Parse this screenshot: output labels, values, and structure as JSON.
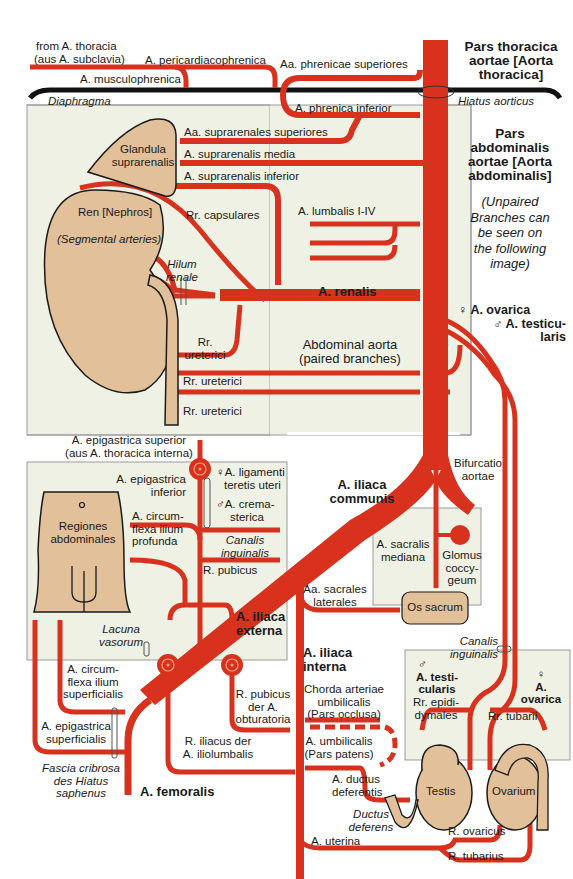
{
  "colors": {
    "artery": "#d8311e",
    "panel_bg": "#eef1e3",
    "organ_fill": "#e2c09a",
    "outline": "#1a1a1a",
    "diaphragm": "#111111",
    "background": "#ffffff"
  },
  "thorax": {
    "from_thoracia": "from A. thoracia",
    "aus_subclavia": "(aus A. subclavia)",
    "pericardiacophrenica": "A. pericardiacophrenica",
    "musculophrenica": "A. musculophrenica",
    "phrenicae_superiores": "Aa. phrenicae superiores",
    "diaphragma": "Diaphragma",
    "hiatus_aorticus": "Hiatus aorticus",
    "pars_thoracica": [
      "Pars thoracica",
      "aortae [Aorta",
      "thoracica]"
    ]
  },
  "abdomen": {
    "phrenica_inferior": "A. phrenica inferior",
    "suprarenales_superiores": "Aa. suprarenales superiores",
    "suprarenalis_media": "A. suprarenalis media",
    "suprarenalis_inferior": "A. suprarenalis inferior",
    "glandula": [
      "Glandula",
      "suprarenalis"
    ],
    "ren": "Ren [Nephros]",
    "segmental": "(Segmental arteries)",
    "capsulares": "Rr. capsulares",
    "lumbalis": "A. lumbalis I-IV",
    "hilum": [
      "Hilum",
      "renale"
    ],
    "renalis": "A. renalis",
    "ureterici_1": [
      "Rr.",
      "ureterici"
    ],
    "ureterici_2": "Rr. ureterici",
    "ureterici_3": "Rr. ureterici",
    "abdominal_aorta": [
      "Abdominal aorta",
      "(paired branches)"
    ],
    "pars_abdominalis": [
      "Pars",
      "abdominalis",
      "aortae [Aorta",
      "abdominalis]"
    ],
    "unpaired_note": [
      "(Unpaired",
      "Branches can",
      "be seen on",
      "the following",
      "image)"
    ],
    "ovarica": "♀ A. ovarica",
    "testicularis": [
      "♂ A. testicu-",
      "laris"
    ]
  },
  "pelvis": {
    "epigastrica_superior": [
      "A. epigastrica superior",
      "(aus A. thoracica interna)"
    ],
    "epigastrica_inferior": [
      "A. epigastrica",
      "inferior"
    ],
    "ligamenti": [
      "♀A. ligamenti",
      "teretis uteri"
    ],
    "cremasterica": [
      "♂A. crema-",
      "sterica"
    ],
    "canalis_inguinalis_1": [
      "Canalis",
      "inguinalis"
    ],
    "regiones": [
      "Regiones",
      "abdominales"
    ],
    "circumflexa_profunda": [
      "A. circum-",
      "flexa ilium",
      "profunda"
    ],
    "r_pubicus": "R. pubicus",
    "iliaca_externa": [
      "A. iliaca",
      "externa"
    ],
    "lacuna": [
      "Lacuna",
      "vasorum"
    ],
    "iliaca_communis": [
      "A. iliaca",
      "communis"
    ],
    "bifurcatio": [
      "Bifurcatio",
      "aortae"
    ],
    "sacralis_mediana": [
      "A. sacralis",
      "mediana"
    ],
    "glomus": [
      "Glomus",
      "coccy-",
      "geum"
    ],
    "sacrales_laterales": [
      "Aa. sacrales",
      "laterales"
    ],
    "os_sacrum": "Os sacrum",
    "canalis_inguinalis_2": [
      "Canalis",
      "inguinalis"
    ],
    "iliaca_interna": [
      "A. iliaca",
      "interna"
    ],
    "chorda": [
      "Chorda arteriae",
      "umbilicalis",
      "(Pars occlusa)"
    ],
    "umbilicalis": [
      "A. umbilicalis",
      "(Pars patens)"
    ],
    "testicularis_m": [
      "♂",
      "A. testi-",
      "cularis"
    ],
    "epididymales": [
      "Rr. epidi-",
      "dymales"
    ],
    "ovarica_f": [
      "♀",
      "A.",
      "ovarica"
    ],
    "tubarii": "Rr. tubarii",
    "testis": "Testis",
    "ovarium": "Ovarium",
    "ductus_deferentis": [
      "A. ductus",
      "deferentis"
    ],
    "ductus_deferens": [
      "Ductus",
      "deferens"
    ],
    "uterina": "A. uterina",
    "r_ovaricus": "R. ovaricus",
    "r_tubarius": "R. tubarius"
  },
  "leg": {
    "circumflexa_superficialis": [
      "A. circum-",
      "flexa ilium",
      "superficialis"
    ],
    "epigastrica_superficialis": [
      "A. epigastrica",
      "superficialis"
    ],
    "fascia": [
      "Fascia cribrosa",
      "des Hiatus",
      "saphenus"
    ],
    "femoralis": "A. femoralis",
    "pubicus_obturatoria": [
      "R. pubicus",
      "der A.",
      "obturatoria"
    ],
    "iliacus_iliolumbalis": [
      "R. iliacus der",
      "A. iliolumbalis"
    ]
  }
}
